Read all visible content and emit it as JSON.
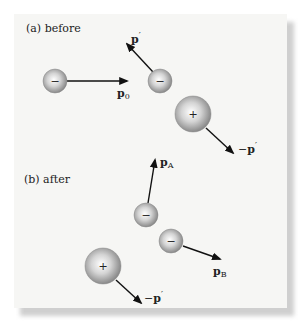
{
  "figure": {
    "panels": [
      {
        "label": "(a) before",
        "particles": [
          {
            "charge": "−",
            "cx": 55,
            "cy": 81,
            "r": 12
          },
          {
            "charge": "−",
            "cx": 160,
            "cy": 81,
            "r": 12
          },
          {
            "charge": "+",
            "cx": 193,
            "cy": 114,
            "r": 18
          }
        ],
        "vectors": [
          {
            "label_main": "p",
            "label_sub": "0",
            "label_sup": "",
            "prefix": ""
          },
          {
            "label_main": "p",
            "label_sub": "",
            "label_sup": "′",
            "prefix": ""
          },
          {
            "label_main": "p",
            "label_sub": "",
            "label_sup": "′",
            "prefix": "−"
          }
        ]
      },
      {
        "label": "(b) after",
        "particles": [
          {
            "charge": "−",
            "cx": 146,
            "cy": 215,
            "r": 12
          },
          {
            "charge": "−",
            "cx": 171,
            "cy": 241,
            "r": 12
          },
          {
            "charge": "+",
            "cx": 103,
            "cy": 266,
            "r": 18
          }
        ],
        "vectors": [
          {
            "label_main": "p",
            "label_sub": "A",
            "label_sup": "",
            "prefix": ""
          },
          {
            "label_main": "p",
            "label_sub": "B",
            "label_sup": "",
            "prefix": ""
          },
          {
            "label_main": "p",
            "label_sub": "",
            "label_sup": "′",
            "prefix": "−"
          }
        ]
      }
    ]
  }
}
